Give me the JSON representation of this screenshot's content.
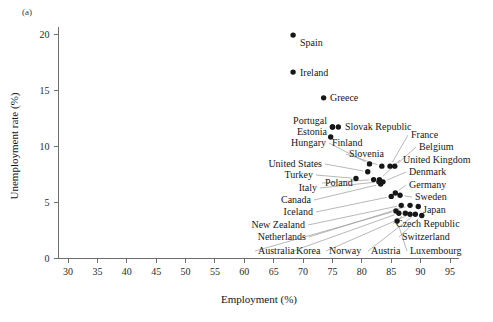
{
  "figure": {
    "panel_label": "(a)",
    "background_color": "#ffffff",
    "point_color": "#171717",
    "axis_color": "#6e6e6e",
    "leader_color": "#9a9a9a"
  },
  "chart_data": {
    "type": "scatter",
    "title": "",
    "xlabel": "Employment (%)",
    "ylabel": "Unemployment rate (%)",
    "xlim": [
      28,
      97
    ],
    "ylim": [
      -0.6,
      21
    ],
    "xticks": [
      30,
      35,
      40,
      45,
      50,
      55,
      60,
      65,
      70,
      75,
      80,
      85,
      90,
      95
    ],
    "yticks": [
      0,
      5,
      10,
      15,
      20
    ],
    "grid": false,
    "legend": null,
    "points": [
      {
        "label": "Spain",
        "x": 68.3,
        "y": 19.9
      },
      {
        "label": "Ireland",
        "x": 68.3,
        "y": 16.6
      },
      {
        "label": "Greece",
        "x": 73.5,
        "y": 14.3
      },
      {
        "label": "Portugal",
        "x": 75.0,
        "y": 11.7
      },
      {
        "label": "Estonia",
        "x": 75.0,
        "y": 11.7
      },
      {
        "label": "Slovak Republic",
        "x": 76.0,
        "y": 11.7
      },
      {
        "label": "Hungary",
        "x": 74.7,
        "y": 10.8
      },
      {
        "label": "Finland",
        "x": 81.3,
        "y": 8.4
      },
      {
        "label": "Slovenia",
        "x": 83.4,
        "y": 8.2
      },
      {
        "label": "France",
        "x": 84.8,
        "y": 8.2
      },
      {
        "label": "Belgium",
        "x": 85.6,
        "y": 8.2
      },
      {
        "label": "United States",
        "x": 81.0,
        "y": 7.7
      },
      {
        "label": "Turkey",
        "x": 79.0,
        "y": 7.1
      },
      {
        "label": "Poland",
        "x": 82.0,
        "y": 7.0
      },
      {
        "label": "United Kingdom",
        "x": 83.0,
        "y": 7.0
      },
      {
        "label": "Italy",
        "x": 82.9,
        "y": 6.8
      },
      {
        "label": "Denmark",
        "x": 83.6,
        "y": 6.8
      },
      {
        "label": "Canada",
        "x": 83.2,
        "y": 6.6
      },
      {
        "label": "Germany",
        "x": 85.7,
        "y": 5.8
      },
      {
        "label": "Sweden",
        "x": 86.5,
        "y": 5.6
      },
      {
        "label": "Iceland",
        "x": 85.0,
        "y": 5.5
      },
      {
        "label": "New Zealand",
        "x": 86.7,
        "y": 4.7
      },
      {
        "label": "Netherlands",
        "x": 88.2,
        "y": 4.7
      },
      {
        "label": "Japan",
        "x": 89.6,
        "y": 4.6
      },
      {
        "label": "Australia",
        "x": 85.8,
        "y": 4.2
      },
      {
        "label": "Korea",
        "x": 86.3,
        "y": 4.0
      },
      {
        "label": "Czech Republic",
        "x": 87.4,
        "y": 4.0
      },
      {
        "label": "Norway",
        "x": 88.2,
        "y": 3.9
      },
      {
        "label": "Austria",
        "x": 89.1,
        "y": 3.9
      },
      {
        "label": "Switzerland",
        "x": 90.2,
        "y": 3.8
      },
      {
        "label": "Luxembourg",
        "x": 86.0,
        "y": 3.3
      }
    ],
    "annotation_labels": {
      "top_right_stack": [
        "Slovak Republic",
        "France",
        "Belgium",
        "United Kingdom",
        "Denmark",
        "Germany",
        "Sweden",
        "Japan",
        "Czech Republic",
        "Switzerland",
        "Luxembourg"
      ],
      "top_center_stack": [
        "Portugal",
        "Estonia",
        "Hungary",
        "Finland",
        "Slovenia"
      ],
      "left_stack": [
        "United States",
        "Turkey",
        "Poland",
        "Italy",
        "Canada",
        "Iceland",
        "New Zealand",
        "Netherlands",
        "Australia"
      ],
      "bottom_stack": [
        "Korea",
        "Norway",
        "Austria",
        "Luxembourg"
      ]
    }
  }
}
